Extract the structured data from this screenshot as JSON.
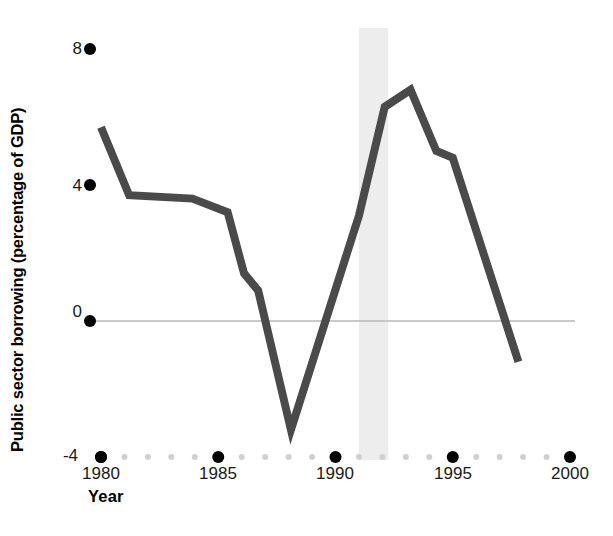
{
  "chart_data": {
    "type": "line",
    "title": "",
    "xlabel": "Year",
    "ylabel": "Public sector borrowing (percentage of GDP)",
    "xlim": [
      1979.3,
      2000.6
    ],
    "ylim": [
      -4,
      8
    ],
    "x_ticks_major": [
      1980,
      1985,
      1990,
      1995,
      2000
    ],
    "x_tick_labels": [
      "1980",
      "1985",
      "1990",
      "1995",
      "2000"
    ],
    "x_ticks_minor": [
      1981,
      1982,
      1983,
      1984,
      1986,
      1987,
      1988,
      1989,
      1991,
      1992,
      1993,
      1994,
      1996,
      1997,
      1998,
      1999
    ],
    "y_ticks": [
      -4,
      0,
      4,
      8
    ],
    "y_tick_labels": [
      "-4",
      "0",
      "4",
      "8"
    ],
    "grid": false,
    "zero_line": true,
    "zero_line_color": "#b8b8b8",
    "series": [
      {
        "name": "Public sector borrowing",
        "color": "#4a4a4a",
        "line_width": 8,
        "x": [
          1980.0,
          1981.2,
          1983.9,
          1985.4,
          1986.1,
          1986.7,
          1988.1,
          1991.0,
          1992.1,
          1993.2,
          1994.3,
          1995.0,
          1997.8
        ],
        "values": [
          5.7,
          3.7,
          3.6,
          3.2,
          1.4,
          0.9,
          -3.2,
          3.1,
          6.3,
          6.8,
          5.0,
          4.8,
          -1.2
        ]
      }
    ],
    "shaded_bands": [
      {
        "name": "recession-band",
        "x_start": 1991.0,
        "x_end": 1992.25,
        "color": "#ededed"
      }
    ],
    "tick_marker_style": {
      "major_color": "#000000",
      "major_radius": 6,
      "minor_color": "#d0d0d0",
      "minor_radius": 3
    }
  },
  "axis": {
    "y_title": "Public sector borrowing (percentage of GDP)",
    "x_title": "Year"
  }
}
